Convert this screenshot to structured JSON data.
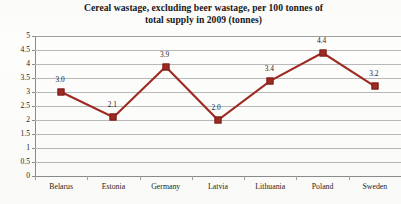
{
  "chart_data": {
    "type": "line",
    "title": "Cereal wastage, excluding beer wastage, per 100 tonnes of total supply in 2009 (tonnes)",
    "title_line1": "Cereal wastage, excluding beer wastage, per 100 tonnes of",
    "title_line2": "total supply in 2009 (tonnes)",
    "xlabel": "",
    "ylabel": "",
    "categories": [
      "Belarus",
      "Estonia",
      "Germany",
      "Latvia",
      "Lithuania",
      "Poland",
      "Sweden"
    ],
    "values": [
      3.0,
      2.1,
      3.9,
      2.0,
      3.4,
      4.4,
      3.2
    ],
    "data_labels": [
      "3.0",
      "2.1",
      "3.9",
      "2.0",
      "3.4",
      "4.4",
      "3.2"
    ],
    "ylim": [
      0,
      5
    ],
    "ytick_values": [
      5,
      4.5,
      4,
      3.5,
      3,
      2.5,
      2,
      1.5,
      1,
      0.5,
      0
    ],
    "ytick_labels": [
      "5",
      "4.5",
      "4",
      "3.5",
      "3",
      "2.5",
      "2",
      "1.5",
      "1",
      "0.5",
      "0"
    ],
    "grid": true,
    "legend": false,
    "legend_position": "none",
    "series_color": "#9e2a23",
    "gridline_color": "#b9b9b9",
    "axis_color": "#8c8c8c",
    "background_color": "#fdfdfb",
    "text_color": "#1c1c1f"
  }
}
